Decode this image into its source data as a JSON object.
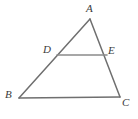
{
  "figure": {
    "type": "geometry-diagram",
    "shape": "triangle-with-midsegment",
    "background_color": "#ffffff",
    "stroke_color": "#6f6f6f",
    "midsegment_color": "#8a8a8a",
    "label_color": "#3b3b3b",
    "width": 138,
    "height": 119,
    "points": {
      "A": {
        "label": "A",
        "x": 90,
        "y": 19
      },
      "B": {
        "label": "B",
        "x": 19,
        "y": 98
      },
      "C": {
        "label": "C",
        "x": 120,
        "y": 97
      },
      "D": {
        "label": "D",
        "x": 57,
        "y": 55
      },
      "E": {
        "label": "E",
        "x": 107,
        "y": 55
      }
    },
    "segments": [
      {
        "name": "AB",
        "from": "A",
        "to": "B"
      },
      {
        "name": "AC",
        "from": "A",
        "to": "C"
      },
      {
        "name": "BC",
        "from": "B",
        "to": "C"
      },
      {
        "name": "DE",
        "from": "D",
        "to": "E"
      }
    ]
  }
}
